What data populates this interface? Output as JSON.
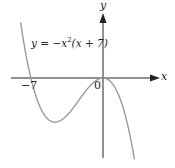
{
  "chart_data": {
    "type": "line",
    "title": "",
    "equation_label": "y = -x²(x + 7)",
    "xlabel": "x",
    "ylabel": "y",
    "x_ticks": [
      {
        "value": -7,
        "label": "-7"
      },
      {
        "value": 0,
        "label": "0"
      }
    ],
    "series": [
      {
        "name": "y = -x^2(x+7)",
        "function": "-x^2(x+7)",
        "x": [
          -8,
          -7,
          -6,
          -4.67,
          -3,
          -2,
          -1,
          0,
          1,
          2
        ],
        "values": [
          64,
          0,
          -36,
          -50.8,
          -36,
          -20,
          -6,
          0,
          -8,
          -36
        ]
      }
    ],
    "xlim": [
      -10,
      6.5
    ],
    "ylim": [
      -95,
      90
    ],
    "grid": false,
    "legend": "none",
    "colors": {
      "axes": "#222222",
      "curve": "#999999"
    }
  },
  "labels": {
    "equation_prefix": "y = −x",
    "equation_power": "2",
    "equation_suffix": "(x + 7)",
    "x_axis": "x",
    "y_axis": "y",
    "tick_neg7": "−7",
    "tick_zero": "0"
  }
}
